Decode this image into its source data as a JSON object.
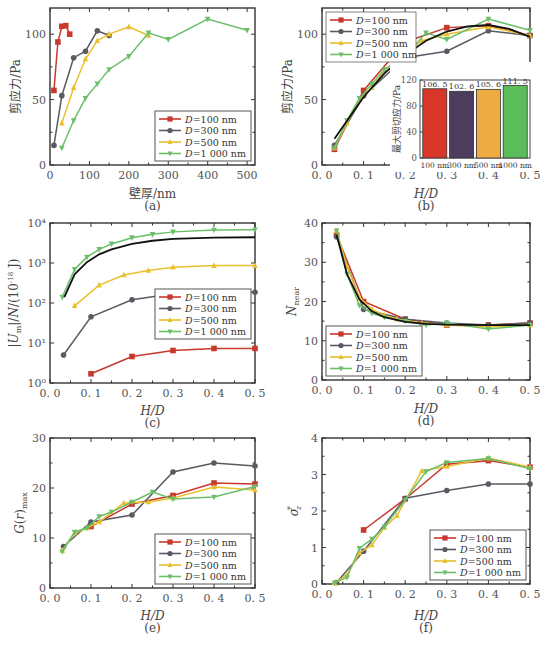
{
  "colors": {
    "D100": "#c8382d",
    "D300": "#5a5a62",
    "D500": "#e9bf2e",
    "D1000": "#6cbf6a",
    "fit": "#111111",
    "bar100": "#d9362a",
    "bar300": "#4e3c5c",
    "bar500": "#eeab42",
    "bar1000": "#5bbd5a"
  },
  "legend_labels": [
    "D=100 nm",
    "D=300 nm",
    "D=500 nm",
    "D=1 000 nm"
  ],
  "chart_data": [
    {
      "id": "a",
      "caption": "(a)",
      "type": "line",
      "xlabel": "壁厚/nm",
      "ylabel": "剪应力/Pa",
      "xlim": [
        0,
        520
      ],
      "ylim": [
        0,
        120
      ],
      "xticks": [
        0,
        100,
        200,
        300,
        400,
        500
      ],
      "yticks": [
        0,
        50,
        100
      ],
      "legend_position": "lower right",
      "series": [
        {
          "name": "D=100 nm",
          "marker": "square",
          "x": [
            10,
            20,
            30,
            40,
            50
          ],
          "y": [
            57,
            94,
            106,
            106.5,
            100
          ]
        },
        {
          "name": "D=300 nm",
          "marker": "circle",
          "x": [
            10,
            30,
            60,
            90,
            120,
            150
          ],
          "y": [
            15,
            53,
            82,
            87,
            102.6,
            99
          ]
        },
        {
          "name": "D=500 nm",
          "marker": "triangle-up",
          "x": [
            30,
            60,
            90,
            120,
            150,
            200,
            250
          ],
          "y": [
            32,
            59,
            81,
            95,
            100,
            105.6,
            99
          ]
        },
        {
          "name": "D=1 000 nm",
          "marker": "triangle-down",
          "x": [
            30,
            60,
            90,
            120,
            150,
            200,
            250,
            300,
            400,
            500
          ],
          "y": [
            13,
            34,
            51,
            62,
            73,
            83,
            101,
            96,
            111.5,
            103
          ]
        }
      ]
    },
    {
      "id": "b",
      "caption": "(b)",
      "type": "line",
      "xlabel": "H/D",
      "ylabel": "剪应力/Pa",
      "xlim": [
        0,
        0.5
      ],
      "ylim": [
        0,
        120
      ],
      "xticks": [
        0.0,
        0.1,
        0.2,
        0.3,
        0.4,
        0.5
      ],
      "yticks": [
        0,
        50,
        100
      ],
      "legend_position": "upper left",
      "series": [
        {
          "name": "D=100 nm",
          "marker": "square",
          "x": [
            0.03,
            0.1,
            0.2,
            0.3,
            0.4,
            0.5
          ],
          "y": [
            12,
            57,
            94,
            105,
            106.5,
            99
          ]
        },
        {
          "name": "D=300 nm",
          "marker": "circle",
          "x": [
            0.03,
            0.1,
            0.2,
            0.3,
            0.4,
            0.5
          ],
          "y": [
            15,
            53,
            82,
            87,
            102.6,
            99
          ]
        },
        {
          "name": "D=500 nm",
          "marker": "triangle-up",
          "x": [
            0.03,
            0.06,
            0.09,
            0.12,
            0.15,
            0.18,
            0.24,
            0.3,
            0.4,
            0.5
          ],
          "y": [
            13,
            32,
            50,
            59,
            72,
            81,
            95,
            100,
            105.6,
            99
          ]
        },
        {
          "name": "D=1 000 nm",
          "marker": "triangle-down",
          "x": [
            0.03,
            0.06,
            0.09,
            0.12,
            0.15,
            0.2,
            0.25,
            0.3,
            0.4,
            0.5
          ],
          "y": [
            13,
            34,
            51,
            62,
            73,
            83,
            101,
            96,
            111.5,
            103
          ]
        }
      ],
      "fit_curve": {
        "x": [
          0.03,
          0.1,
          0.15,
          0.2,
          0.25,
          0.3,
          0.35,
          0.4,
          0.45,
          0.5
        ],
        "y": [
          20,
          52,
          70,
          84,
          95,
          102,
          106,
          107,
          104,
          98
        ]
      },
      "inset": {
        "type": "bar",
        "ylabel": "最大剪切应力/Pa",
        "ylim": [
          0,
          120
        ],
        "yticks": [
          0,
          40,
          80,
          120
        ],
        "categories": [
          "100 nm",
          "300 nm",
          "500 nm",
          "1000 nm"
        ],
        "values": [
          106.5,
          102.6,
          105.6,
          111.5
        ],
        "value_labels": [
          "106. 5",
          "102. 6",
          "105. 6",
          "111. 5"
        ]
      }
    },
    {
      "id": "c",
      "caption": "(c)",
      "type": "line",
      "yscale": "log",
      "xlabel": "H/D",
      "ylabel": "|Um|/N/(10^-18 J)",
      "xlim": [
        0,
        0.5
      ],
      "ylim": [
        1,
        10000
      ],
      "xticks": [
        0.0,
        0.1,
        0.2,
        0.3,
        0.4,
        0.5
      ],
      "yticks": [
        1,
        10,
        100,
        1000,
        10000
      ],
      "ytick_labels": [
        "10⁰",
        "10¹",
        "10²",
        "10³",
        "10⁴"
      ],
      "legend_position": "center right",
      "series": [
        {
          "name": "D=100 nm",
          "marker": "square",
          "x": [
            0.1,
            0.2,
            0.3,
            0.4,
            0.5
          ],
          "y": [
            1.7,
            4.6,
            6.5,
            7.3,
            7.3
          ]
        },
        {
          "name": "D=300 nm",
          "marker": "circle",
          "x": [
            0.033,
            0.1,
            0.2,
            0.3,
            0.4,
            0.5
          ],
          "y": [
            5,
            45,
            120,
            170,
            185,
            185
          ]
        },
        {
          "name": "D=500 nm",
          "marker": "triangle-up",
          "x": [
            0.06,
            0.12,
            0.18,
            0.24,
            0.3,
            0.4,
            0.5
          ],
          "y": [
            85,
            280,
            500,
            650,
            780,
            860,
            860
          ]
        },
        {
          "name": "D=1 000 nm",
          "marker": "triangle-down",
          "x": [
            0.03,
            0.06,
            0.09,
            0.12,
            0.15,
            0.2,
            0.25,
            0.3,
            0.4,
            0.5
          ],
          "y": [
            140,
            700,
            1400,
            2200,
            3000,
            4300,
            5200,
            6000,
            6700,
            6800
          ]
        }
      ],
      "fit_curve": {
        "x": [
          0.035,
          0.06,
          0.09,
          0.12,
          0.15,
          0.2,
          0.25,
          0.3,
          0.4,
          0.5
        ],
        "y": [
          140,
          520,
          1050,
          1650,
          2200,
          3000,
          3600,
          4000,
          4300,
          4400
        ]
      }
    },
    {
      "id": "d",
      "caption": "(d)",
      "type": "line",
      "xlabel": "H/D",
      "ylabel": "N_near",
      "xlim": [
        0,
        0.5
      ],
      "ylim": [
        0,
        40
      ],
      "xticks": [
        0.0,
        0.1,
        0.2,
        0.3,
        0.4,
        0.5
      ],
      "yticks": [
        0,
        10,
        20,
        30,
        40
      ],
      "legend_position": "lower left",
      "series": [
        {
          "name": "D=100 nm",
          "marker": "square",
          "x": [
            0.035,
            0.1,
            0.2,
            0.3,
            0.4,
            0.5
          ],
          "y": [
            37,
            20,
            15.5,
            14,
            14,
            14.5
          ]
        },
        {
          "name": "D=300 nm",
          "marker": "circle",
          "x": [
            0.035,
            0.1,
            0.2,
            0.3,
            0.4,
            0.5
          ],
          "y": [
            36.5,
            18,
            15.5,
            14.5,
            14,
            14.5
          ]
        },
        {
          "name": "D=500 nm",
          "marker": "triangle-up",
          "x": [
            0.035,
            0.06,
            0.09,
            0.12,
            0.15,
            0.18,
            0.24,
            0.3,
            0.4,
            0.5
          ],
          "y": [
            38,
            29,
            21,
            18,
            16.5,
            15.5,
            14.5,
            14,
            13.5,
            14
          ]
        },
        {
          "name": "D=1 000 nm",
          "marker": "triangle-down",
          "x": [
            0.035,
            0.06,
            0.09,
            0.12,
            0.15,
            0.2,
            0.25,
            0.3,
            0.4,
            0.5
          ],
          "y": [
            38,
            27,
            19,
            17,
            16,
            15,
            14,
            14.5,
            13,
            14
          ]
        }
      ],
      "fit_curve": {
        "x": [
          0.035,
          0.06,
          0.09,
          0.12,
          0.15,
          0.2,
          0.25,
          0.3,
          0.4,
          0.5
        ],
        "y": [
          37,
          27,
          20.5,
          17.5,
          16,
          14.8,
          14.3,
          14.1,
          14,
          14
        ]
      }
    },
    {
      "id": "e",
      "caption": "(e)",
      "type": "line",
      "xlabel": "H/D",
      "ylabel": "G(r)max",
      "xlim": [
        0,
        0.5
      ],
      "ylim": [
        0,
        30
      ],
      "xticks": [
        0.0,
        0.1,
        0.2,
        0.3,
        0.4,
        0.5
      ],
      "yticks": [
        0,
        10,
        20,
        30
      ],
      "legend_position": "lower right",
      "series": [
        {
          "name": "D=100 nm",
          "marker": "square",
          "x": [
            0.1,
            0.2,
            0.3,
            0.4,
            0.5
          ],
          "y": [
            12.3,
            16.8,
            18.5,
            21,
            20.8
          ]
        },
        {
          "name": "D=300 nm",
          "marker": "circle",
          "x": [
            0.033,
            0.1,
            0.2,
            0.3,
            0.4,
            0.5
          ],
          "y": [
            8.3,
            13.2,
            14.6,
            23.2,
            25,
            24.4
          ]
        },
        {
          "name": "D=500 nm",
          "marker": "triangle-up",
          "x": [
            0.03,
            0.06,
            0.09,
            0.12,
            0.18,
            0.24,
            0.3,
            0.4,
            0.5
          ],
          "y": [
            7.5,
            11,
            12,
            13.2,
            17,
            17.2,
            18,
            20.2,
            19.6
          ]
        },
        {
          "name": "D=1 000 nm",
          "marker": "triangle-down",
          "x": [
            0.03,
            0.06,
            0.09,
            0.12,
            0.15,
            0.2,
            0.25,
            0.3,
            0.4,
            0.5
          ],
          "y": [
            7.3,
            11.2,
            12,
            14.3,
            15.2,
            17.2,
            19.2,
            17.8,
            18.2,
            20.3
          ]
        }
      ]
    },
    {
      "id": "f",
      "caption": "(f)",
      "type": "line",
      "xlabel": "H/D",
      "ylabel": "σ*z",
      "xlim": [
        0,
        0.5
      ],
      "ylim": [
        0,
        4
      ],
      "xticks": [
        0.0,
        0.1,
        0.2,
        0.3,
        0.4,
        0.5
      ],
      "yticks": [
        0,
        1,
        2,
        3,
        4
      ],
      "legend_position": "lower right",
      "series": [
        {
          "name": "D=100 nm",
          "marker": "square",
          "x": [
            0.1,
            0.2,
            0.3,
            0.4,
            0.5
          ],
          "y": [
            1.48,
            2.33,
            3.28,
            3.38,
            3.2
          ]
        },
        {
          "name": "D=300 nm",
          "marker": "circle",
          "x": [
            0.035,
            0.1,
            0.2,
            0.3,
            0.4,
            0.5
          ],
          "y": [
            0.04,
            0.9,
            2.35,
            2.56,
            2.74,
            2.74
          ]
        },
        {
          "name": "D=500 nm",
          "marker": "triangle-up",
          "x": [
            0.03,
            0.06,
            0.09,
            0.12,
            0.15,
            0.18,
            0.24,
            0.3,
            0.4,
            0.5
          ],
          "y": [
            0.03,
            0.25,
            0.85,
            1.07,
            1.55,
            1.87,
            3.1,
            3.22,
            3.45,
            3.2
          ]
        },
        {
          "name": "D=1 000 nm",
          "marker": "triangle-down",
          "x": [
            0.03,
            0.06,
            0.09,
            0.12,
            0.15,
            0.2,
            0.25,
            0.3,
            0.4,
            0.5
          ],
          "y": [
            0.03,
            0.18,
            0.98,
            1.23,
            1.57,
            2.3,
            3.08,
            3.33,
            3.44,
            3.16
          ]
        }
      ]
    }
  ]
}
